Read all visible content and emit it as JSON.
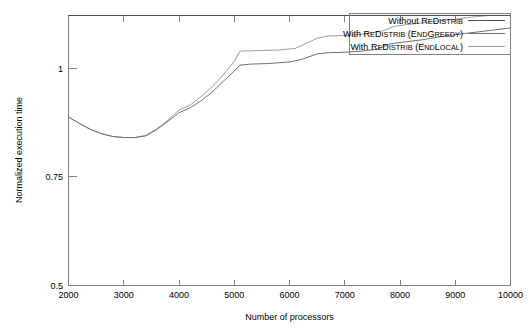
{
  "chart_data": {
    "type": "line",
    "title": "",
    "xlabel": "Number of processors",
    "ylabel": "Normalized execution time",
    "xlim": [
      2000,
      10000
    ],
    "ylim": [
      0.5,
      1.0
    ],
    "xticks": [
      2000,
      3000,
      4000,
      5000,
      6000,
      7000,
      8000,
      9000,
      10000
    ],
    "xtick_labels": [
      "2000",
      "3000",
      "4000",
      "5000",
      "6000",
      "7000",
      "8000",
      "9000",
      "10000"
    ],
    "yticks": [
      0.5,
      0.75,
      1.0
    ],
    "ytick_labels": [
      "0.5",
      "0.75",
      "1"
    ],
    "grid": false,
    "legend_position": "top-right",
    "series": [
      {
        "name": "Without ReDistrib",
        "name_parts": [
          "Without ",
          "R",
          "e",
          "D",
          "istrib"
        ],
        "color": "#4d4d4d",
        "x": [
          2000,
          10000
        ],
        "values": [
          1.0,
          1.0
        ]
      },
      {
        "name": "With ReDistrib (EndGreedy)",
        "name_parts": [
          "With ",
          "R",
          "e",
          "D",
          "istrib",
          " (",
          "E",
          "nd",
          "G",
          "reedy",
          ")"
        ],
        "color": "#707070",
        "x": [
          2000,
          2200,
          2400,
          2600,
          2800,
          3000,
          3200,
          3400,
          3600,
          3800,
          4000,
          4200,
          4400,
          4600,
          4800,
          5000,
          5100,
          5300,
          5600,
          6000,
          6200,
          6500,
          6700,
          7000,
          7300,
          7600,
          7800,
          8000,
          8400,
          8800,
          9200,
          9600,
          10000
        ],
        "values": [
          0.812,
          0.8,
          0.789,
          0.781,
          0.776,
          0.774,
          0.774,
          0.777,
          0.789,
          0.804,
          0.82,
          0.829,
          0.842,
          0.858,
          0.878,
          0.897,
          0.908,
          0.91,
          0.911,
          0.914,
          0.918,
          0.929,
          0.931,
          0.932,
          0.934,
          0.938,
          0.947,
          0.95,
          0.955,
          0.962,
          0.967,
          0.972,
          0.977
        ]
      },
      {
        "name": "With ReDistrib (EndLocal)",
        "name_parts": [
          "With ",
          "R",
          "e",
          "D",
          "istrib",
          " (",
          "E",
          "nd",
          "L",
          "ocal",
          ")"
        ],
        "color": "#9c9c9c",
        "x": [
          2000,
          2200,
          2400,
          2600,
          2800,
          3000,
          3200,
          3400,
          3600,
          3800,
          4000,
          4200,
          4400,
          4600,
          4800,
          5000,
          5100,
          5400,
          5800,
          6100,
          6300,
          6500,
          6700,
          7000,
          7400,
          7700,
          7900,
          8200,
          8600,
          9000,
          9300,
          9600,
          10000
        ],
        "values": [
          0.812,
          0.8,
          0.789,
          0.781,
          0.776,
          0.774,
          0.774,
          0.778,
          0.79,
          0.806,
          0.825,
          0.834,
          0.85,
          0.868,
          0.89,
          0.915,
          0.934,
          0.935,
          0.936,
          0.939,
          0.948,
          0.958,
          0.962,
          0.963,
          0.966,
          0.972,
          0.98,
          0.984,
          0.989,
          0.993,
          0.997,
          1.0,
          1.0
        ]
      }
    ]
  },
  "axes": {
    "y_axis_title": "Normalized execution time",
    "x_axis_title": "Number of processors"
  }
}
